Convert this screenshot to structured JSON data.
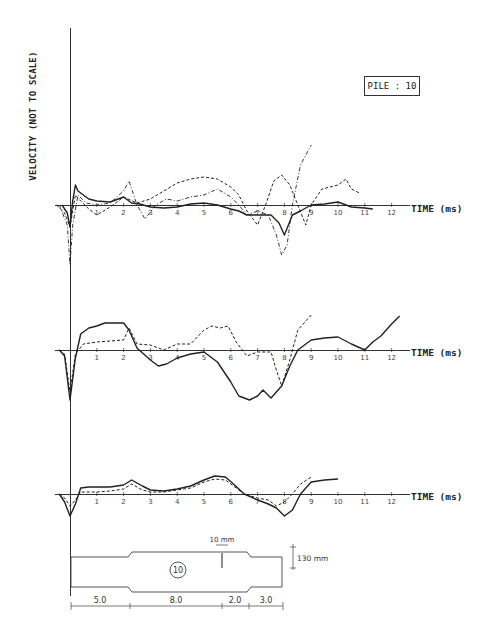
{
  "figure": {
    "title_box": "PILE : 10",
    "y_axis_label": "VELOCITY (NOT TO SCALE)",
    "x_axis_label": "TIME (ms)",
    "pile_drawing": {
      "pile_number": "10",
      "notch_label": "10 mm",
      "diameter_label": "130 mm",
      "segments": [
        "5.0",
        "8.0",
        "2.0",
        "3.0"
      ]
    }
  },
  "chart_data": [
    {
      "type": "line",
      "panel": "top",
      "title": "PILE : 10",
      "xlabel": "TIME (ms)",
      "ylabel": "VELOCITY (NOT TO SCALE)",
      "x_ticks": [
        1,
        2,
        3,
        4,
        5,
        6,
        7,
        8,
        9,
        10,
        11,
        12
      ],
      "xlim": [
        -0.5,
        12.8
      ],
      "grid": false,
      "series": [
        {
          "name": "solid",
          "style": "solid",
          "x": [
            -0.3,
            -0.1,
            0.0,
            0.1,
            0.2,
            0.3,
            0.5,
            0.7,
            1.0,
            1.5,
            2.0,
            2.3,
            2.6,
            3.0,
            3.5,
            4.0,
            4.5,
            5.0,
            5.5,
            6.0,
            6.3,
            6.6,
            7.0,
            7.5,
            7.8,
            8.0,
            8.3,
            8.6,
            9.0,
            9.5,
            10.0,
            10.5,
            11.0,
            11.3
          ],
          "y": [
            0,
            -8,
            -22,
            4,
            20,
            14,
            10,
            6,
            4,
            3,
            8,
            2,
            1,
            -2,
            -3,
            -2,
            1,
            2,
            0,
            -4,
            -6,
            -10,
            -10,
            -10,
            -18,
            -30,
            -10,
            -6,
            0,
            1,
            3,
            -2,
            -3,
            -4
          ]
        },
        {
          "name": "dashed",
          "style": "dashed",
          "x": [
            -0.5,
            -0.2,
            0.0,
            0.2,
            0.4,
            0.7,
            1.0,
            1.5,
            2.0,
            2.5,
            3.0,
            3.5,
            4.0,
            4.5,
            5.0,
            5.5,
            6.0,
            6.3,
            6.6,
            7.0,
            7.3,
            7.6,
            7.9,
            8.2,
            8.5,
            8.8,
            9.0,
            9.4,
            10.0,
            10.3,
            10.5,
            10.8
          ],
          "y": [
            0,
            -8,
            -22,
            10,
            4,
            -4,
            -10,
            -2,
            8,
            2,
            6,
            14,
            22,
            26,
            28,
            26,
            18,
            10,
            -6,
            -20,
            0,
            24,
            30,
            20,
            0,
            -20,
            0,
            16,
            20,
            26,
            16,
            12
          ]
        },
        {
          "name": "dash-dot",
          "style": "dashdot",
          "x": [
            -0.4,
            -0.1,
            0.0,
            0.1,
            0.3,
            0.6,
            1.0,
            1.5,
            2.0,
            2.2,
            2.5,
            2.8,
            3.2,
            3.6,
            4.0,
            4.5,
            5.0,
            5.5,
            6.0,
            6.3,
            6.6,
            7.0,
            7.4,
            7.7,
            7.9,
            8.1,
            8.3,
            8.6,
            9.0
          ],
          "y": [
            0,
            -20,
            -60,
            -20,
            10,
            2,
            0,
            2,
            14,
            24,
            0,
            -14,
            0,
            6,
            4,
            8,
            10,
            16,
            8,
            0,
            -10,
            -6,
            -10,
            -30,
            -50,
            -40,
            0,
            40,
            60
          ]
        }
      ]
    },
    {
      "type": "line",
      "panel": "middle",
      "xlabel": "TIME (ms)",
      "x_ticks": [
        1,
        2,
        3,
        4,
        5,
        6,
        7,
        8,
        9,
        10,
        11,
        12
      ],
      "xlim": [
        -0.5,
        12.8
      ],
      "grid": false,
      "series": [
        {
          "name": "solid",
          "style": "solid",
          "x": [
            -0.4,
            -0.2,
            0.0,
            0.2,
            0.4,
            0.7,
            1.0,
            1.3,
            1.6,
            2.0,
            2.2,
            2.5,
            3.0,
            3.3,
            3.6,
            4.0,
            4.5,
            5.0,
            5.5,
            6.0,
            6.3,
            6.7,
            7.0,
            7.2,
            7.5,
            7.9,
            8.2,
            8.5,
            9.0,
            9.5,
            10.0,
            10.5,
            11.0,
            11.3,
            11.6,
            12.0,
            12.3
          ],
          "y": [
            0,
            -6,
            -50,
            -8,
            16,
            22,
            24,
            27,
            27,
            27,
            20,
            2,
            -10,
            -16,
            -14,
            -8,
            -4,
            -2,
            -12,
            -32,
            -46,
            -50,
            -46,
            -40,
            -48,
            -36,
            -16,
            0,
            10,
            12,
            13,
            6,
            0,
            8,
            14,
            26,
            34
          ]
        },
        {
          "name": "dashed",
          "style": "dashed",
          "x": [
            -0.4,
            -0.2,
            0.0,
            0.2,
            0.5,
            1.0,
            1.5,
            2.0,
            2.2,
            2.5,
            3.0,
            3.5,
            4.0,
            4.5,
            5.0,
            5.3,
            5.6,
            5.9,
            6.2,
            6.6,
            7.0,
            7.5,
            7.7,
            7.9,
            8.2,
            8.5,
            9.0
          ],
          "y": [
            0,
            -4,
            -42,
            -4,
            6,
            8,
            9,
            10,
            22,
            6,
            5,
            0,
            6,
            6,
            20,
            24,
            22,
            24,
            8,
            -6,
            -2,
            -2,
            -20,
            -36,
            -10,
            20,
            35
          ]
        }
      ]
    },
    {
      "type": "line",
      "panel": "bottom",
      "xlabel": "TIME (ms)",
      "x_ticks": [
        1,
        2,
        3,
        4,
        5,
        6,
        7,
        8,
        9,
        10,
        11,
        12
      ],
      "xlim": [
        -0.5,
        12.8
      ],
      "grid": false,
      "series": [
        {
          "name": "solid",
          "style": "solid",
          "x": [
            -0.4,
            -0.2,
            0.0,
            0.2,
            0.4,
            0.7,
            1.0,
            1.5,
            2.0,
            2.3,
            2.7,
            3.0,
            3.5,
            4.0,
            4.5,
            5.0,
            5.4,
            5.8,
            6.1,
            6.5,
            7.0,
            7.4,
            7.7,
            8.0,
            8.3,
            8.6,
            9.0,
            9.5,
            10.0
          ],
          "y": [
            0,
            -8,
            -22,
            -10,
            6,
            7,
            7,
            7,
            9,
            14,
            8,
            4,
            3,
            5,
            8,
            14,
            18,
            17,
            10,
            0,
            -6,
            -10,
            -14,
            -22,
            -16,
            0,
            12,
            14,
            15
          ]
        },
        {
          "name": "dashed",
          "style": "dashed",
          "x": [
            -0.4,
            -0.2,
            0.0,
            0.2,
            0.4,
            1.0,
            1.5,
            2.0,
            2.3,
            2.7,
            3.0,
            3.5,
            4.0,
            4.5,
            5.0,
            5.4,
            5.8,
            6.1,
            6.5,
            7.0,
            7.4,
            7.7,
            8.0,
            8.3,
            8.6,
            9.0
          ],
          "y": [
            0,
            -4,
            -12,
            -6,
            2,
            2,
            3,
            5,
            10,
            4,
            2,
            2,
            4,
            6,
            12,
            15,
            14,
            8,
            0,
            -4,
            -6,
            -12,
            -8,
            0,
            10,
            17
          ]
        }
      ]
    }
  ]
}
